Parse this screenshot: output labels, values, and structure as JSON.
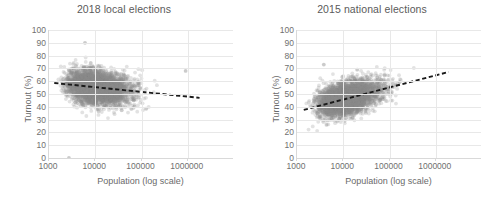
{
  "figure": {
    "panels": [
      {
        "id": "left",
        "title": "2018 local elections",
        "xlabel": "Population (log scale)",
        "ylabel": "Turnout (%)"
      },
      {
        "id": "right",
        "title": "2015 national elections",
        "xlabel": "Population (log scale)",
        "ylabel": "Turnout (%)"
      }
    ],
    "yticks": [
      "100",
      "90",
      "80",
      "70",
      "60",
      "50",
      "40",
      "30",
      "20",
      "10",
      "0"
    ],
    "xticks": [
      "1000",
      "10000",
      "100000",
      "1000000"
    ],
    "colors": {
      "point": "#8c8c8c",
      "trendline": "#1a1a1a",
      "gridline": "#e8e8e8",
      "axis": "#d9d9d9",
      "text": "#6a6a6a",
      "title": "#5a5a5a"
    }
  },
  "chart_data": [
    {
      "type": "scatter",
      "panel": "2018 local elections",
      "title": "2018 local elections",
      "xlabel": "Population (log scale)",
      "ylabel": "Turnout (%)",
      "xscale": "log",
      "xlim": [
        1000,
        10000000
      ],
      "ylim": [
        0,
        100
      ],
      "ytick_step": 10,
      "xticks": [
        1000,
        10000,
        100000,
        1000000
      ],
      "yticks": [
        0,
        10,
        20,
        30,
        40,
        50,
        60,
        70,
        80,
        90,
        100
      ],
      "grid": true,
      "legend": "none",
      "marker_color": "#8c8c8c",
      "marker_opacity": 0.25,
      "n_points_approx": 4000,
      "cloud": {
        "x_range_log10": [
          3.2,
          6.3
        ],
        "x_mode_log10": 3.85,
        "y_center_at_x3k": 58,
        "y_center_at_x10k": 55,
        "y_center_at_x100k": 51,
        "y_center_at_x1M": 49,
        "y_spread_sd": 6.5,
        "y_min_observed": 30,
        "y_max_observed": 76,
        "outliers": [
          {
            "x": 2700,
            "y": 0
          },
          {
            "x": 6000,
            "y": 90
          },
          {
            "x": 900000,
            "y": 68
          }
        ]
      },
      "trendline": {
        "type": "linear-in-log10x",
        "dashed": true,
        "x_start": 1300,
        "y_start": 58.6,
        "x_end": 1800000,
        "y_end": 47.0,
        "slope_per_decade": -3.7,
        "direction": "negative"
      }
    },
    {
      "type": "scatter",
      "panel": "2015 national elections",
      "title": "2015 national elections",
      "xlabel": "Population (log scale)",
      "ylabel": "Turnout (%)",
      "xscale": "log",
      "xlim": [
        1000,
        10000000
      ],
      "ylim": [
        0,
        100
      ],
      "ytick_step": 10,
      "xticks": [
        1000,
        10000,
        100000,
        1000000
      ],
      "yticks": [
        0,
        10,
        20,
        30,
        40,
        50,
        60,
        70,
        80,
        90,
        100
      ],
      "grid": true,
      "legend": "none",
      "marker_color": "#8c8c8c",
      "marker_opacity": 0.25,
      "n_points_approx": 4000,
      "cloud": {
        "x_range_log10": [
          3.2,
          6.3
        ],
        "x_mode_log10": 3.9,
        "y_center_at_x3k": 42,
        "y_center_at_x10k": 46,
        "y_center_at_x100k": 55,
        "y_center_at_x1M": 62,
        "y_spread_sd": 6.0,
        "y_min_observed": 24,
        "y_max_observed": 74,
        "outliers": [
          {
            "x": 3800,
            "y": 73
          },
          {
            "x": 20000,
            "y": 69
          }
        ]
      },
      "trendline": {
        "type": "linear-in-log10x",
        "dashed": true,
        "x_start": 1400,
        "y_start": 37.6,
        "x_end": 1900000,
        "y_end": 67.2,
        "slope_per_decade": 9.5,
        "direction": "positive"
      }
    }
  ]
}
